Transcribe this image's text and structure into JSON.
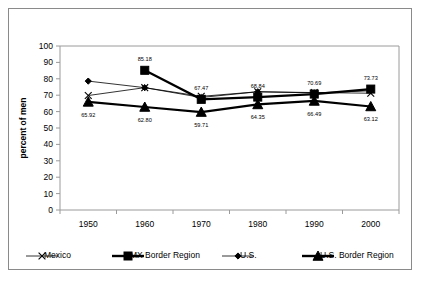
{
  "chart_data": {
    "type": "line",
    "title": "",
    "xlabel": "",
    "ylabel": "percent of men",
    "categories": [
      "1950",
      "1960",
      "1970",
      "1980",
      "1990",
      "2000"
    ],
    "x": [
      1950,
      1960,
      1970,
      1980,
      1990,
      2000
    ],
    "ylim": [
      0,
      100
    ],
    "yticks": [
      "0",
      "10",
      "20",
      "30",
      "40",
      "50",
      "60",
      "70",
      "80",
      "90",
      "100"
    ],
    "ytick_values": [
      0,
      10,
      20,
      30,
      40,
      50,
      60,
      70,
      80,
      90,
      100
    ],
    "grid": false,
    "legend_position": "bottom",
    "series": [
      {
        "name": "Mexico",
        "marker": "x",
        "line_weight": "thin",
        "values": [
          69.8,
          74.6,
          69.3,
          72.1,
          71.6,
          71.2
        ],
        "labels": [
          "",
          "",
          "",
          "",
          "",
          ""
        ]
      },
      {
        "name": "MX Border Region",
        "marker": "square",
        "line_weight": "thick",
        "values": [
          null,
          85.18,
          67.47,
          68.84,
          70.69,
          73.73
        ],
        "labels": [
          "",
          "85.18",
          "67.47",
          "68.84",
          "70.69",
          "73.73"
        ]
      },
      {
        "name": "U.S.",
        "marker": "diamond",
        "line_weight": "thin",
        "values": [
          78.6,
          74.6,
          68.6,
          72.1,
          71.4,
          72.7
        ],
        "labels": [
          "",
          "",
          "",
          "",
          "",
          ""
        ]
      },
      {
        "name": "U.S. Border Region",
        "marker": "triangle",
        "line_weight": "thick",
        "values": [
          65.92,
          62.8,
          59.71,
          64.35,
          66.49,
          63.12
        ],
        "labels": [
          "65.92",
          "62.80",
          "59.71",
          "64.35",
          "66.49",
          "63.12"
        ]
      }
    ]
  },
  "legend": {
    "items": [
      {
        "label": "Mexico",
        "marker": "x",
        "line_weight": "thin"
      },
      {
        "label": "MX Border Region",
        "marker": "square",
        "line_weight": "thick"
      },
      {
        "label": "U.S.",
        "marker": "diamond",
        "line_weight": "thin"
      },
      {
        "label": "U.S. Border Region",
        "marker": "triangle",
        "line_weight": "thick"
      }
    ]
  },
  "colors": {
    "foreground": "#000000",
    "axis": "#9a9a9a",
    "frame": "#8a8a8a",
    "background": "#ffffff"
  }
}
